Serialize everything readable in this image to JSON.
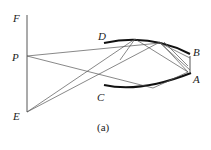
{
  "figure": {
    "caption": "(a)",
    "labels": {
      "F": "F",
      "P": "P",
      "E": "E",
      "D": "D",
      "C": "C",
      "B": "B",
      "A": "A"
    }
  }
}
